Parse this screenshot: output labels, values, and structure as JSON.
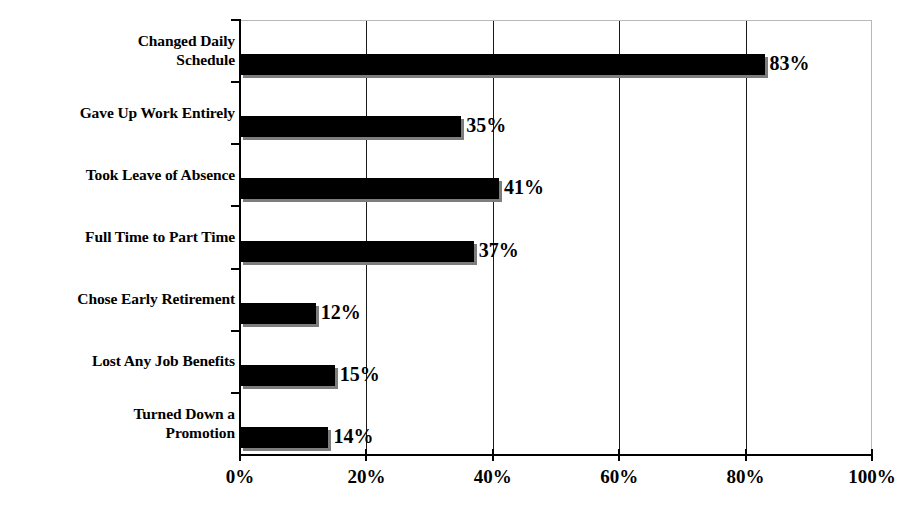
{
  "chart_data": {
    "type": "bar",
    "orientation": "horizontal",
    "title": "",
    "subtitle": "",
    "xlabel": "",
    "ylabel": "",
    "categories": [
      "Changed Daily\nSchedule",
      "Gave Up Work Entirely",
      "Took Leave of Absence",
      "Full Time to Part Time",
      "Chose Early Retirement",
      "Lost Any Job Benefits",
      "Turned Down a\nPromotion"
    ],
    "values": [
      83,
      35,
      41,
      37,
      12,
      15,
      14
    ],
    "data_labels": [
      "83%",
      "35%",
      "41%",
      "37%",
      "12%",
      "15%",
      "14%"
    ],
    "xlim": [
      0,
      100
    ],
    "x_ticks": [
      0,
      20,
      40,
      60,
      80,
      100
    ],
    "x_tick_labels": [
      "0%",
      "20%",
      "40%",
      "60%",
      "80%",
      "100%"
    ],
    "grid": "vertical",
    "gridlines_at": [
      20,
      40,
      60,
      80
    ],
    "legend": "none",
    "legend_position": "none",
    "series": [
      {
        "name": "Percent",
        "values": [
          83,
          35,
          41,
          37,
          12,
          15,
          14
        ]
      }
    ],
    "colors": {
      "bar_fill": "#000000",
      "bar_shadow": "#7d7d7d",
      "axis": "#000000",
      "gridline": "#1a1a1a",
      "frame": "#b8b8b8",
      "background": "#ffffff",
      "text": "#000000"
    }
  }
}
